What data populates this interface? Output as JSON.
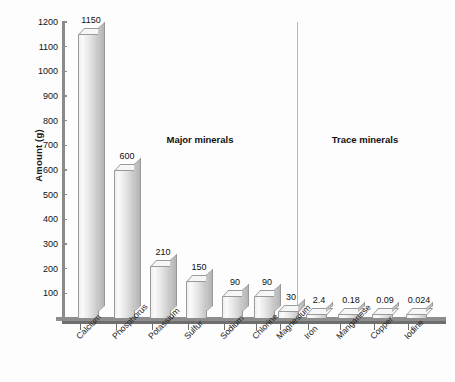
{
  "chart_data": {
    "type": "bar",
    "title": "",
    "xlabel": "",
    "ylabel": "Amount (g)",
    "ylim": [
      0,
      1200
    ],
    "ytick_step": 100,
    "yticks": [
      100,
      200,
      300,
      400,
      500,
      600,
      700,
      800,
      900,
      1000,
      1100,
      1200
    ],
    "grid": false,
    "legend": "none",
    "categories": [
      "Calcium",
      "Phosphorus",
      "Potassium",
      "Sulfur",
      "Sodium",
      "Chlorine",
      "Magnesium",
      "Iron",
      "Manganese",
      "Copper",
      "Iodine"
    ],
    "values": [
      1150,
      600,
      210,
      150,
      90,
      90,
      30,
      2.4,
      0.18,
      0.09,
      0.024
    ],
    "value_labels": [
      "1150",
      "600",
      "210",
      "150",
      "90",
      "90",
      "30",
      "2.4",
      "0.18",
      "0.09",
      "0.024"
    ],
    "annotations": [
      {
        "text": "Major minerals",
        "group": "major"
      },
      {
        "text": "Trace minerals",
        "group": "trace"
      }
    ],
    "groups": {
      "major": [
        "Calcium",
        "Phosphorus",
        "Potassium",
        "Sulfur",
        "Sodium",
        "Chlorine",
        "Magnesium"
      ],
      "trace": [
        "Iron",
        "Manganese",
        "Copper",
        "Iodine"
      ]
    },
    "colors": {
      "bar_face": "#e6e6e6",
      "bar_top": "#f6f6f6",
      "bar_side": "#c0c0c0",
      "axis": "#8b8b8b",
      "text": "#111111",
      "background": "#fdfdfd",
      "divider": "#b9b9b9"
    }
  }
}
